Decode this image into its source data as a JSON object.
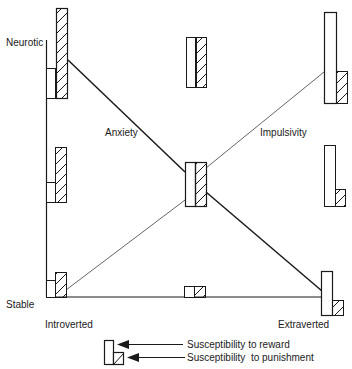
{
  "diagram": {
    "axes": {
      "y_top_label": "Neurotic",
      "y_bottom_label": "Stable",
      "x_left_label": "Introverted",
      "x_right_label": "Extraverted"
    },
    "lines": {
      "anxiety_label": "Anxiety",
      "impulsivity_label": "Impulsivity"
    },
    "legend": {
      "reward_label": "Susceptibility to reward",
      "punishment_label": "Susceptibility  to punishment"
    },
    "colors": {
      "stroke": "#1a1a1a",
      "faint_line": "#555555",
      "background": "#ffffff"
    },
    "bar_pairs": [
      {
        "position": "top-left",
        "reward": "low",
        "punishment": "very high"
      },
      {
        "position": "top-center",
        "reward": "high",
        "punishment": "high"
      },
      {
        "position": "top-right",
        "reward": "very high",
        "punishment": "low"
      },
      {
        "position": "middle-left",
        "reward": "low",
        "punishment": "high"
      },
      {
        "position": "center",
        "reward": "medium",
        "punishment": "medium"
      },
      {
        "position": "middle-right",
        "reward": "high",
        "punishment": "low"
      },
      {
        "position": "bottom-left",
        "reward": "low",
        "punishment": "low"
      },
      {
        "position": "bottom-center",
        "reward": "very low",
        "punishment": "very low"
      },
      {
        "position": "bottom-right",
        "reward": "medium",
        "punishment": "very low"
      }
    ]
  }
}
